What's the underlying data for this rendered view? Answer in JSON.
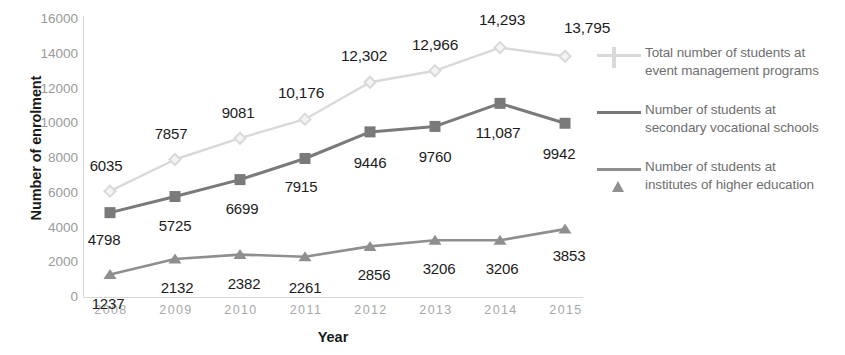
{
  "chart_data": {
    "type": "line",
    "title": "",
    "xlabel": "Year",
    "ylabel": "Number of enrolment",
    "categories": [
      "2008",
      "2009",
      "2010",
      "2011",
      "2012",
      "2013",
      "2014",
      "2015"
    ],
    "ylim": [
      0,
      16000
    ],
    "yticks": [
      "0",
      "2000",
      "4000",
      "6000",
      "8000",
      "10000",
      "12000",
      "14000",
      "16000"
    ],
    "ytick_values": [
      0,
      2000,
      4000,
      6000,
      8000,
      10000,
      12000,
      14000,
      16000
    ],
    "grid": false,
    "legend_position": "right",
    "series": [
      {
        "name": "Total number of students at event management programs",
        "name_line1": "Total number of students at",
        "name_line2": "event management programs",
        "color": "#d9d9d9",
        "marker": "diamond",
        "values": [
          6035,
          7857,
          9081,
          10176,
          12302,
          12966,
          14293,
          13795
        ],
        "labels": [
          "6035",
          "7857",
          "9081",
          "10,176",
          "12,302",
          "12,966",
          "14,293",
          "13,795"
        ]
      },
      {
        "name": "Number of students at secondary vocational schools",
        "name_line1": "Number of students at",
        "name_line2": "secondary vocational schools",
        "color": "#7a7a7a",
        "marker": "square",
        "values": [
          4798,
          5725,
          6699,
          7915,
          9446,
          9760,
          11087,
          9942
        ],
        "labels": [
          "4798",
          "5725",
          "6699",
          "7915",
          "9446",
          "9760",
          "11,087",
          "9942"
        ]
      },
      {
        "name": "Number of students at institutes of higher education",
        "name_line1": "Number of students at",
        "name_line2": "institutes of higher education",
        "color": "#8f8f8f",
        "marker": "triangle",
        "values": [
          1237,
          2132,
          2382,
          2261,
          2856,
          3206,
          3206,
          3853
        ],
        "labels": [
          "1237",
          "2132",
          "2382",
          "2261",
          "2856",
          "3206",
          "3206",
          "3853"
        ]
      }
    ]
  },
  "axis": {
    "y_title": "Number of enrolment",
    "x_title": "Year"
  }
}
